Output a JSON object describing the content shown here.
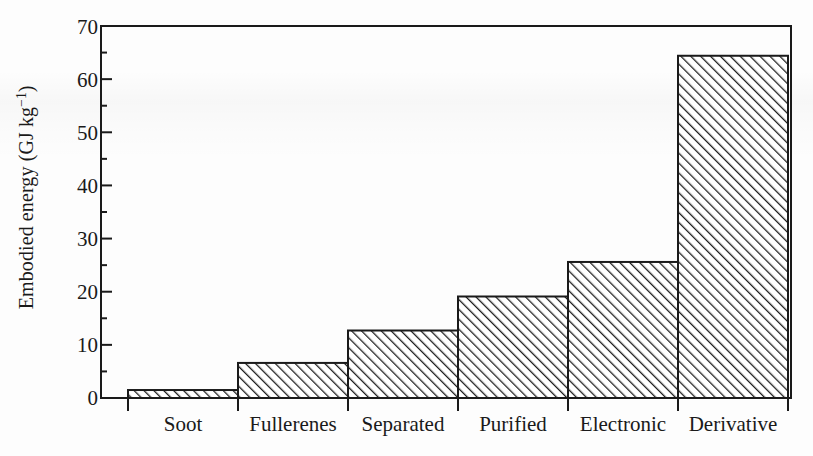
{
  "chart_data": {
    "type": "bar",
    "title": "",
    "xlabel": "",
    "ylabel": "Embodied energy (GJ kg⁻¹)",
    "ylabel_text": "Embodied energy (GJ kg",
    "ylabel_exponent": "−1",
    "ylabel_tail": ")",
    "categories": [
      "Soot",
      "Fullerenes",
      "Separated",
      "Purified",
      "Electronic",
      "Derivative"
    ],
    "values": [
      1.5,
      6.6,
      12.7,
      19.1,
      25.6,
      64.4
    ],
    "ylim": [
      0,
      70
    ],
    "ytick_values": [
      0,
      10,
      20,
      30,
      40,
      50,
      60,
      70
    ],
    "ytick_labels": [
      "0",
      "10",
      "20",
      "30",
      "40",
      "50",
      "60",
      "70"
    ],
    "yminor_values": [
      5,
      15,
      25,
      35,
      45,
      55,
      65
    ],
    "grid": false,
    "legend": null,
    "bar_fill": "#ffffff",
    "bar_edge": "#1a1a1a",
    "bar_hatch": "diagonal-forward-slash",
    "axis_color": "#1a1a1a",
    "background": "#fdfdfd"
  },
  "axis": {
    "frame": {
      "left": 101,
      "right": 791,
      "top": 26,
      "bottom": 398
    },
    "bar_band_left": 128,
    "bar_band_width": 110
  }
}
